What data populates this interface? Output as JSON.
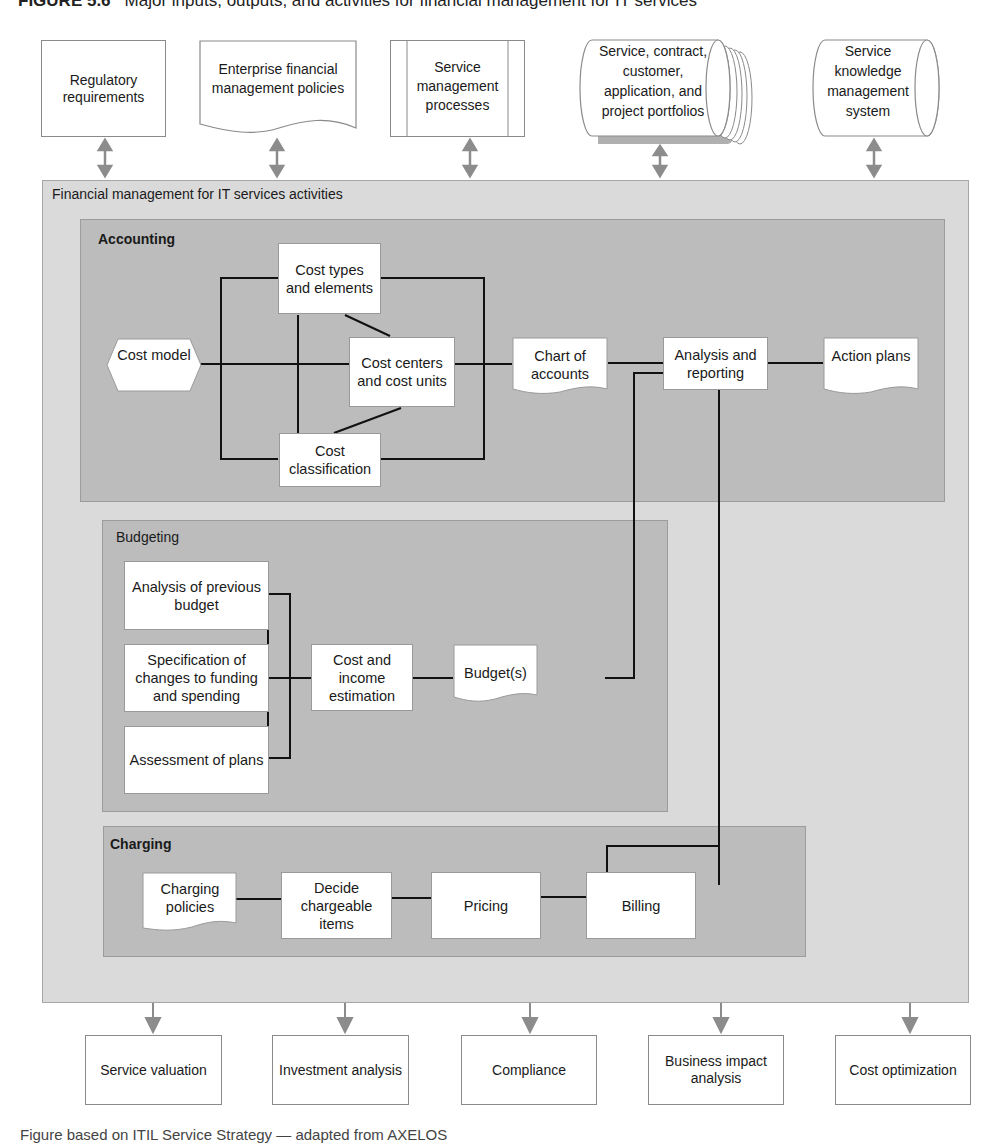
{
  "figure": {
    "title_number": "FIGURE 5.6",
    "title_text": "Major inputs, outputs, and activities for financial management for IT services",
    "caption": "Figure based on ITIL Service Strategy — adapted from AXELOS"
  },
  "inputs": [
    {
      "label": "Regulatory requirements",
      "shape": "rectangle"
    },
    {
      "label": "Enterprise financial management policies",
      "shape": "document"
    },
    {
      "label": "Service management processes",
      "shape": "predefined-process"
    },
    {
      "label": "Service, contract, customer, application, and project portfolios",
      "shape": "stacked-cylinder"
    },
    {
      "label": "Service knowledge management system",
      "shape": "cylinder"
    }
  ],
  "container": {
    "label": "Financial management for IT services activities"
  },
  "accounting": {
    "label": "Accounting",
    "nodes": {
      "cost_model": "Cost model",
      "cost_types": "Cost types and elements",
      "cost_centers": "Cost centers and cost units",
      "cost_classification": "Cost classification",
      "chart_of_accounts": "Chart of accounts",
      "analysis_reporting": "Analysis and reporting",
      "action_plans": "Action plans"
    }
  },
  "budgeting": {
    "label": "Budgeting",
    "nodes": {
      "analysis_previous": "Analysis of previous budget",
      "specification": "Specification of changes to funding and spending",
      "assessment": "Assessment of plans",
      "estimation": "Cost and income estimation",
      "budgets": "Budget(s)"
    }
  },
  "charging": {
    "label": "Charging",
    "nodes": {
      "policies": "Charging policies",
      "decide": "Decide chargeable items",
      "pricing": "Pricing",
      "billing": "Billing"
    }
  },
  "outputs": [
    {
      "label": "Service valuation"
    },
    {
      "label": "Investment analysis"
    },
    {
      "label": "Compliance"
    },
    {
      "label": "Business impact analysis"
    },
    {
      "label": "Cost optimization"
    }
  ],
  "colors": {
    "container_fill": "#dadada",
    "section_fill": "#bcbcbc",
    "connector": "#111111",
    "arrow": "#8c8c8c"
  }
}
